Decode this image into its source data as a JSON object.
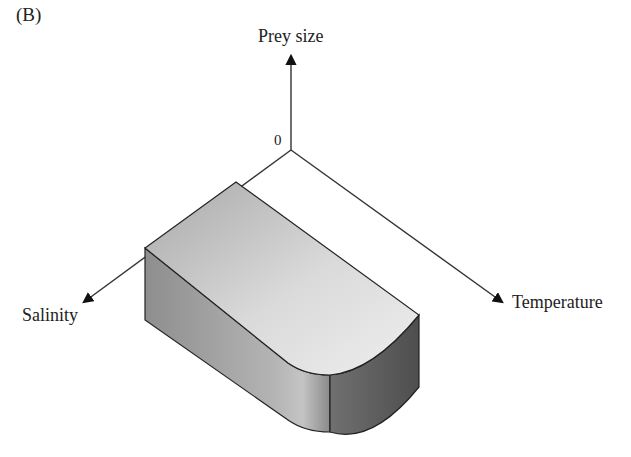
{
  "figure": {
    "panel_label": "(B)",
    "axes": {
      "vertical": {
        "label": "Prey size"
      },
      "left": {
        "label": "Salinity"
      },
      "right": {
        "label": "Temperature"
      },
      "origin": {
        "label": "0"
      }
    },
    "shape": {
      "description": "tolerance-range block (rounded corner at high temperature / high salinity)"
    },
    "colors": {
      "axis": "#222222",
      "top_face_light": "#e6e6e6",
      "top_face_dark": "#a9a9a9",
      "side_face_left": "#9e9e9e",
      "side_face_right": "#6f6f6f"
    }
  }
}
